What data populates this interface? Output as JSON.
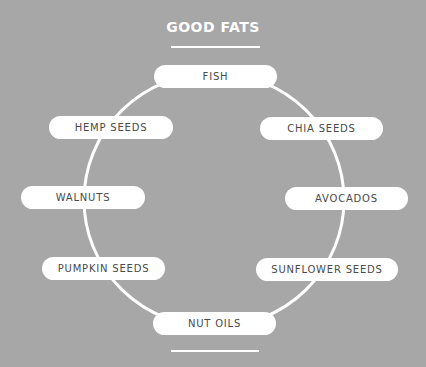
{
  "title": "GOOD FATS",
  "colors": {
    "background": "#a7a7a7",
    "pill_fill": "#ffffff",
    "pill_text": "#4a4a4a",
    "ring_stroke": "#ffffff"
  },
  "items": [
    {
      "label": "FISH"
    },
    {
      "label": "HEMP SEEDS"
    },
    {
      "label": "CHIA SEEDS"
    },
    {
      "label": "WALNUTS"
    },
    {
      "label": "AVOCADOS"
    },
    {
      "label": "PUMPKIN SEEDS"
    },
    {
      "label": "SUNFLOWER SEEDS"
    },
    {
      "label": "NUT OILS"
    }
  ]
}
